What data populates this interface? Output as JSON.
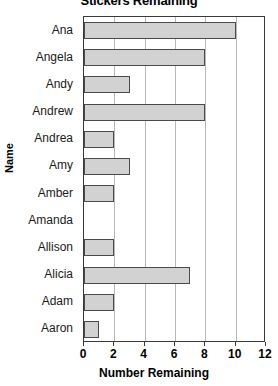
{
  "chart_data": {
    "type": "bar",
    "orientation": "horizontal",
    "title": "Stickers Remaining",
    "xlabel": "Number Remaining",
    "ylabel": "Name",
    "categories": [
      "Ana",
      "Angela",
      "Andy",
      "Andrew",
      "Andrea",
      "Amy",
      "Amber",
      "Amanda",
      "Allison",
      "Alicia",
      "Adam",
      "Aaron"
    ],
    "values": [
      10,
      8,
      3,
      8,
      2,
      3,
      2,
      0,
      2,
      7,
      2,
      1
    ],
    "xlim": [
      0,
      12
    ],
    "xticks": [
      0,
      2,
      4,
      6,
      8,
      10,
      12
    ],
    "xtick_labels": [
      "0",
      "2",
      "4",
      "6",
      "8",
      "10",
      "12"
    ],
    "grid": "vertical",
    "legend": "none",
    "bar_fill_color": "#d2d2d2",
    "bar_edge_color": "#4a4a4a",
    "axis_color": "#3a3a3a",
    "gridline_color": "#b8b8b8",
    "background_color": "#ffffff"
  }
}
